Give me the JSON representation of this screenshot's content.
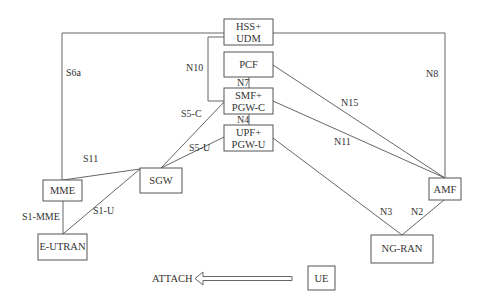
{
  "diagram": {
    "nodes": {
      "hss_udm": {
        "line1": "HSS+",
        "line2": "UDM"
      },
      "pcf": {
        "label": "PCF"
      },
      "smf_pgwc": {
        "line1": "SMF+",
        "line2": "PGW-C"
      },
      "upf_pgwu": {
        "line1": "UPF+",
        "line2": "PGW-U"
      },
      "sgw": {
        "label": "SGW"
      },
      "mme": {
        "label": "MME"
      },
      "eutran": {
        "label": "E-UTRAN"
      },
      "amf": {
        "label": "AMF"
      },
      "ngran": {
        "label": "NG-RAN"
      },
      "ue": {
        "label": "UE"
      }
    },
    "interfaces": {
      "s6a": "S6a",
      "n10": "N10",
      "n7": "N7",
      "n4": "N4",
      "s5c": "S5-C",
      "s5u": "S5-U",
      "s11": "S11",
      "s1mme": "S1-MME",
      "s1u": "S1-U",
      "n8": "N8",
      "n15": "N15",
      "n11": "N11",
      "n3": "N3",
      "n2": "N2"
    },
    "attach_label": "ATTACH",
    "colors": {
      "line": "#555555",
      "text": "#333333",
      "background": "#ffffff"
    }
  }
}
